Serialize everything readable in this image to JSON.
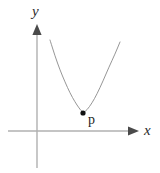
{
  "figure": {
    "background_color": "#ffffff",
    "width": 160,
    "height": 173
  },
  "axes": {
    "x_axis": {
      "label": "x",
      "color": "#b0b0b0",
      "start_x": 8,
      "end_x": 138,
      "y": 131,
      "arrowhead": "right",
      "arrow_color": "#4a4a4a"
    },
    "y_axis": {
      "label": "y",
      "color": "#b0b0b0",
      "x": 37,
      "top_y": 25,
      "bottom_y": 168,
      "arrowhead": "up",
      "arrow_color": "#4a4a4a"
    }
  },
  "curve": {
    "type": "parabola",
    "color": "#8a8a8a",
    "stroke_width": 0.9,
    "vertex": {
      "x": 83,
      "y": 113
    },
    "left_endpoint": {
      "x": 50,
      "y": 40
    },
    "right_endpoint": {
      "x": 120,
      "y": 42
    },
    "opens": "up"
  },
  "point": {
    "label": "p",
    "color": "#111111",
    "x": 83,
    "y": 113,
    "radius": 2.6,
    "label_x": 89,
    "label_y": 117
  },
  "chart_data": {
    "type": "line",
    "title": "",
    "xlabel": "x",
    "ylabel": "y",
    "grid": false,
    "legend": "none",
    "annotations": [
      {
        "text": "p",
        "x": 83,
        "y": 113,
        "marker": "filled-dot"
      }
    ],
    "series": [
      {
        "name": "parabola",
        "points_px": [
          [
            50,
            40
          ],
          [
            55,
            56
          ],
          [
            60,
            70
          ],
          [
            65,
            82
          ],
          [
            70,
            93
          ],
          [
            75,
            102
          ],
          [
            79,
            108
          ],
          [
            83,
            113
          ],
          [
            87,
            110
          ],
          [
            92,
            103
          ],
          [
            97,
            94
          ],
          [
            103,
            81
          ],
          [
            109,
            67
          ],
          [
            115,
            54
          ],
          [
            120,
            42
          ]
        ]
      }
    ]
  }
}
